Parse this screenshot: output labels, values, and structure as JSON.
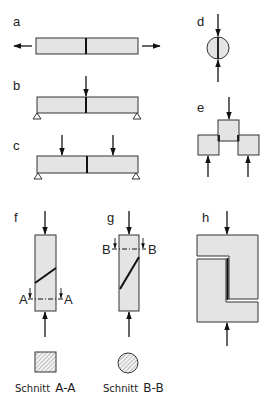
{
  "figure": {
    "type": "technical-drawing",
    "colors": {
      "fill": "#e4e4e4",
      "stroke": "#333333",
      "joint": "#111111",
      "background": "#ffffff"
    },
    "panels": [
      {
        "id": "a",
        "label": "a",
        "case": "butt joint under tension"
      },
      {
        "id": "b",
        "label": "b",
        "case": "butt joint in beam, 3-point bending"
      },
      {
        "id": "c",
        "label": "c",
        "case": "butt joint in beam, 4-point bending"
      },
      {
        "id": "d",
        "label": "d",
        "case": "round specimen under compression"
      },
      {
        "id": "e",
        "label": "e",
        "case": "double-lap blocks under compression shear"
      },
      {
        "id": "f",
        "label": "f",
        "case": "scarf joint under compression",
        "section_mark": "A"
      },
      {
        "id": "g",
        "label": "g",
        "case": "scarf joint under compression",
        "section_mark": "B"
      },
      {
        "id": "h",
        "label": "h",
        "case": "interlocking specimen under compression"
      }
    ],
    "sections": [
      {
        "id": "A-A",
        "shape": "square",
        "caption_word": "Schnitt",
        "caption_mark": "A-A"
      },
      {
        "id": "B-B",
        "shape": "circle",
        "caption_word": "Schnitt",
        "caption_mark": "B-B"
      }
    ]
  }
}
